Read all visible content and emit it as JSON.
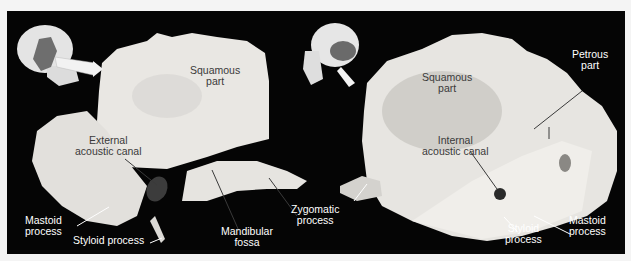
{
  "figure": {
    "background": "#050505",
    "bone_color": "#e8e6e2",
    "highlight_color": "#6a6a6a",
    "left_panel": {
      "view": "lateral view",
      "orientation_icon": "skull-lateral-icon",
      "labels": {
        "squamous_part_1": "Squamous",
        "squamous_part_2": "part",
        "external_acoustic_canal_1": "External",
        "external_acoustic_canal_2": "acoustic canal",
        "mastoid_process_1": "Mastoid",
        "mastoid_process_2": "process",
        "styloid_process": "Styloid process",
        "mandibular_fossa_1": "Mandibular",
        "mandibular_fossa_2": "fossa"
      }
    },
    "center": {
      "zygomatic_process_1": "Zygomatic",
      "zygomatic_process_2": "process"
    },
    "right_panel": {
      "view": "medial view",
      "orientation_icon": "skull-medial-icon",
      "labels": {
        "squamous_part_1": "Squamous",
        "squamous_part_2": "part",
        "petrous_part_1": "Petrous",
        "petrous_part_2": "part",
        "internal_acoustic_canal_1": "Internal",
        "internal_acoustic_canal_2": "acoustic canal",
        "styloid_process_1": "Styloid",
        "styloid_process_2": "process",
        "mastoid_process_1": "Mastoid",
        "mastoid_process_2": "process"
      }
    }
  }
}
